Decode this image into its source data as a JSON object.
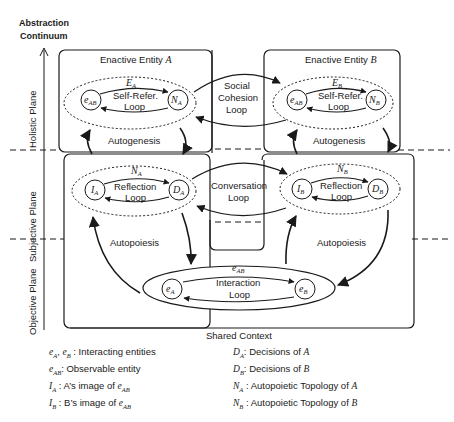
{
  "axis": {
    "title_line1": "Abstraction",
    "title_line2": "Continuum",
    "planes": [
      "Holistic Plane",
      "Subjective Plane",
      "Objective Plane"
    ]
  },
  "entities": {
    "a": {
      "title": "Enactive Entity",
      "var": "A",
      "outer": "E",
      "outer_sub": "A",
      "loop_l1": "Self-Refer.",
      "loop_l2": "Loop",
      "node_left": "e",
      "node_left_sub": "AB",
      "node_right": "N",
      "node_right_sub": "A"
    },
    "b": {
      "title": "Enactive Entity",
      "var": "B",
      "outer": "E",
      "outer_sub": "B",
      "loop_l1": "Self-Refer.",
      "loop_l2": "Loop",
      "node_left": "e",
      "node_left_sub": "AB",
      "node_right": "N",
      "node_right_sub": "B"
    }
  },
  "subjective": {
    "a": {
      "outer": "N",
      "outer_sub": "A",
      "loop_l1": "Reflection",
      "loop_l2": "Loop",
      "node_left": "I",
      "node_left_sub": "A",
      "node_right": "D",
      "node_right_sub": "A"
    },
    "b": {
      "outer": "N",
      "outer_sub": "B",
      "loop_l1": "Reflection",
      "loop_l2": "Loop",
      "node_left": "I",
      "node_left_sub": "B",
      "node_right": "D",
      "node_right_sub": "B"
    }
  },
  "loops": {
    "social_l1": "Social",
    "social_l2": "Cohesion",
    "social_l3": "Loop",
    "conversation_l1": "Conversation",
    "conversation_l2": "Loop",
    "autogenesis": "Autogenesis",
    "autopoiesis": "Autopoiesis",
    "interaction_l1": "Interaction",
    "interaction_l2": "Loop"
  },
  "objective": {
    "outer": "e",
    "outer_sub": "AB",
    "node_left": "e",
    "node_left_sub": "A",
    "node_right": "e",
    "node_right_sub": "B"
  },
  "shared_context": "Shared Context",
  "legend": {
    "left": [
      {
        "sym": "e",
        "sub": "A",
        "sym2": "e",
        "sub2": "B",
        "text": " : Interacting entities"
      },
      {
        "sym": "e",
        "sub": "AB",
        "text": ": Observable entity"
      },
      {
        "sym": "I",
        "sub": "A",
        "text": " : A’s image of ",
        "tail": "e",
        "tail_sub": "AB"
      },
      {
        "sym": "I",
        "sub": "B",
        "text": " : B’s image of ",
        "tail": "e",
        "tail_sub": "AB"
      }
    ],
    "right": [
      {
        "sym": "D",
        "sub": "A",
        "text": ": Decisions of ",
        "tail": "A"
      },
      {
        "sym": "D",
        "sub": "B",
        "text": ": Decisions of ",
        "tail": "B"
      },
      {
        "sym": "N",
        "sub": "A",
        "text": " : Autopoietic Topology of ",
        "tail": "A"
      },
      {
        "sym": "N",
        "sub": "B",
        "text": " : Autopoietic Topology of ",
        "tail": "B"
      }
    ]
  }
}
